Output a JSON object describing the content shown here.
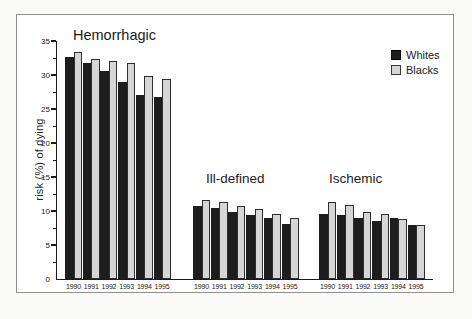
{
  "chart_data": {
    "type": "bar",
    "title": "",
    "xlabel": "",
    "ylabel": "risk (%) of dying",
    "ylim": [
      0,
      35
    ],
    "yticks": [
      0,
      5,
      10,
      15,
      20,
      25,
      30,
      35
    ],
    "grid": false,
    "legend_position": "top-right",
    "legend": [
      "Whites",
      "Blacks"
    ],
    "series_colors": {
      "Whites": "#1d1d1d",
      "Blacks": "#d6d6d6"
    },
    "groups": [
      {
        "label": "Hemorrhagic",
        "categories": [
          "1990",
          "1991",
          "1992",
          "1993",
          "1994",
          "1995"
        ],
        "series": [
          {
            "name": "Whites",
            "values": [
              32.7,
              31.8,
              30.6,
              28.9,
              27.1,
              26.7
            ]
          },
          {
            "name": "Blacks",
            "values": [
              33.4,
              32.4,
              32.0,
              31.8,
              29.9,
              29.4
            ]
          }
        ]
      },
      {
        "label": "Ill-defined",
        "categories": [
          "1990",
          "1991",
          "1992",
          "1993",
          "1994",
          "1995"
        ],
        "series": [
          {
            "name": "Whites",
            "values": [
              10.8,
              10.5,
              9.9,
              9.4,
              9.0,
              8.1
            ]
          },
          {
            "name": "Blacks",
            "values": [
              11.6,
              11.3,
              10.8,
              10.3,
              9.6,
              8.9
            ]
          }
        ]
      },
      {
        "label": "Ischemic",
        "categories": [
          "1990",
          "1991",
          "1992",
          "1993",
          "1994",
          "1995"
        ],
        "series": [
          {
            "name": "Whites",
            "values": [
              9.5,
              9.4,
              9.0,
              8.5,
              8.9,
              8.0
            ]
          },
          {
            "name": "Blacks",
            "values": [
              11.3,
              10.9,
              9.8,
              9.5,
              8.8,
              8.0
            ]
          }
        ]
      }
    ]
  }
}
